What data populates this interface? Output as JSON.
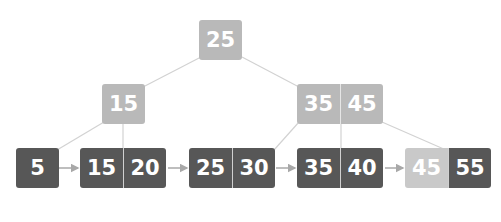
{
  "diagram": {
    "type": "B+ tree",
    "colors": {
      "internal_node": "#b9b9b9",
      "leaf_node": "#575757",
      "highlighted_key": "#c9c9c9",
      "edge": "#cfcfcf",
      "leaf_link": "#a8a8a8",
      "key_text": "#ffffff"
    },
    "root": {
      "keys": [
        "25"
      ]
    },
    "internal": [
      {
        "keys": [
          "15"
        ]
      },
      {
        "keys": [
          "35",
          "45"
        ]
      }
    ],
    "leaves": [
      {
        "keys": [
          "5"
        ]
      },
      {
        "keys": [
          "15",
          "20"
        ]
      },
      {
        "keys": [
          "25",
          "30"
        ]
      },
      {
        "keys": [
          "35",
          "40"
        ]
      },
      {
        "keys": [
          "45",
          "55"
        ],
        "highlighted_key_index": 0
      }
    ]
  }
}
